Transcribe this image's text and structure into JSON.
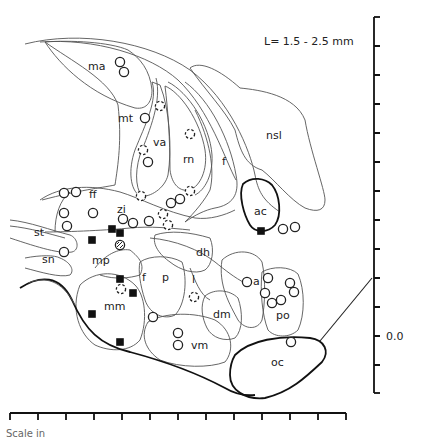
{
  "figure": {
    "title": "L= 1.5 - 2.5 mm",
    "vertical_scale_label": "0.0",
    "footer_label": "Scale in"
  },
  "regions": {
    "ma": "ma",
    "mt": "mt",
    "va": "va",
    "rn": "rn",
    "f_upper": "f",
    "nsl": "nsl",
    "ac": "ac",
    "ff": "ff",
    "zi": "zi",
    "st": "st",
    "sn": "sn",
    "mp": "mp",
    "f_lower": "f",
    "p": "p",
    "dh": "dh",
    "l": "l",
    "a": "a",
    "dm": "dm",
    "po": "po",
    "mm": "mm",
    "vm": "vm",
    "oc": "oc"
  },
  "legend_symbols": {
    "open_circle": "open-circle",
    "dashed_circle": "dashed-circle",
    "hatched_circle": "hatched-circle",
    "filled_square": "filled-square"
  },
  "markers": {
    "open_circles": [
      [
        120,
        62
      ],
      [
        124,
        72
      ],
      [
        145,
        118
      ],
      [
        148,
        162
      ],
      [
        64,
        193
      ],
      [
        76,
        192
      ],
      [
        64,
        213
      ],
      [
        93,
        213
      ],
      [
        67,
        226
      ],
      [
        123,
        219
      ],
      [
        133,
        223
      ],
      [
        149,
        221
      ],
      [
        171,
        203
      ],
      [
        180,
        199
      ],
      [
        64,
        252
      ],
      [
        153,
        317
      ],
      [
        247,
        282
      ],
      [
        268,
        278
      ],
      [
        265,
        293
      ],
      [
        290,
        283
      ],
      [
        294,
        292
      ],
      [
        272,
        303
      ],
      [
        281,
        300
      ],
      [
        178,
        333
      ],
      [
        178,
        345
      ],
      [
        291,
        342
      ],
      [
        283,
        229
      ],
      [
        295,
        227
      ]
    ],
    "dashed_circles": [
      [
        160,
        106
      ],
      [
        190,
        134
      ],
      [
        143,
        150
      ],
      [
        141,
        196
      ],
      [
        190,
        191
      ],
      [
        163,
        214
      ],
      [
        168,
        225
      ],
      [
        121,
        289
      ],
      [
        194,
        297
      ]
    ],
    "hatched_circles": [
      [
        120,
        245
      ]
    ],
    "filled_squares": [
      [
        112,
        229
      ],
      [
        120,
        233
      ],
      [
        92,
        240
      ],
      [
        120,
        279
      ],
      [
        133,
        293
      ],
      [
        92,
        314
      ],
      [
        120,
        342
      ],
      [
        261,
        231
      ]
    ]
  },
  "chart_data": {
    "type": "diagram",
    "title": "L= 1.5 - 2.5 mm",
    "vertical_axis": {
      "ticks": 14,
      "labeled_tick": "0.0"
    },
    "horizontal_axis": {
      "ticks": 13
    },
    "structures": [
      "ma",
      "mt",
      "va",
      "rn",
      "f",
      "nsl",
      "ac",
      "ff",
      "zi",
      "st",
      "sn",
      "mp",
      "p",
      "dh",
      "l",
      "a",
      "dm",
      "po",
      "mm",
      "vm",
      "oc"
    ]
  }
}
